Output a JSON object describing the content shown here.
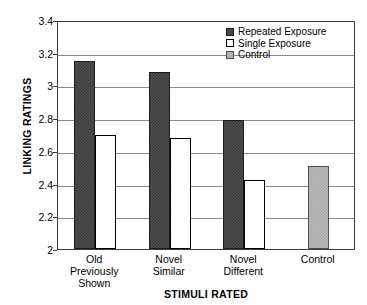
{
  "chart_data": {
    "type": "bar",
    "title": "",
    "xlabel": "STIMULI RATED",
    "ylabel": "LINKING RATINGS",
    "ylim": [
      2,
      3.4
    ],
    "yticks": [
      "2",
      "2.2",
      "2.4",
      "2.6",
      "2.8",
      "3",
      "3.2",
      "3.4"
    ],
    "ytick_values": [
      2,
      2.2,
      2.4,
      2.6,
      2.8,
      3,
      3.2,
      3.4
    ],
    "grid": true,
    "legend_position": "top-right",
    "categories": [
      "Old\nPreviously\nShown",
      "Novel\nSimilar",
      "Novel\nDifferent",
      "Control"
    ],
    "series": [
      {
        "name": "Repeated Exposure",
        "color": "#4d4d4d",
        "values": [
          3.15,
          3.08,
          2.79,
          null
        ]
      },
      {
        "name": "Single Exposure",
        "color": "#ffffff",
        "values": [
          2.7,
          2.68,
          2.42,
          null
        ]
      },
      {
        "name": "Control",
        "color": "#b9b9b9",
        "values": [
          null,
          null,
          null,
          2.51
        ]
      }
    ]
  },
  "legend": {
    "items": [
      {
        "label": "Repeated Exposure",
        "swatch": "repeated"
      },
      {
        "label": "Single Exposure",
        "swatch": "single"
      },
      {
        "label": "Control",
        "swatch": "control"
      }
    ]
  },
  "axes": {
    "y_title": "LINKING RATINGS",
    "x_title": "STIMULI RATED",
    "y_ticks": [
      "3.4",
      "3.2",
      "3",
      "2.8",
      "2.6",
      "2.4",
      "2.2",
      "2"
    ],
    "x_categories": [
      "Old\nPreviously\nShown",
      "Novel\nSimilar",
      "Novel\nDifferent",
      "Control"
    ]
  }
}
